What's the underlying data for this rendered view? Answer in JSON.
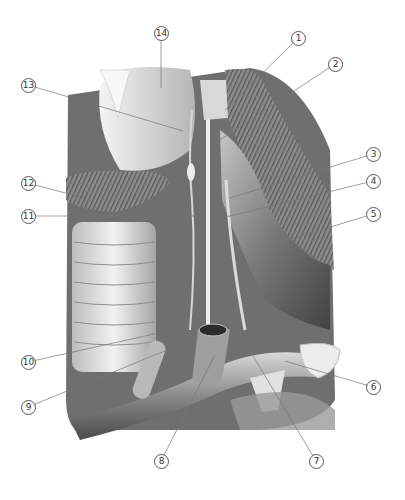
{
  "figure": {
    "type": "anatomical illustration",
    "style": "grayscale pencil rendering"
  },
  "labels": [
    {
      "n": "1",
      "glyph": "①",
      "x": 298,
      "y": 38,
      "tx": 225,
      "ty": 110
    },
    {
      "n": "2",
      "glyph": "②",
      "x": 335,
      "y": 64,
      "tx": 218,
      "ty": 141
    },
    {
      "n": "3",
      "glyph": "③",
      "x": 373,
      "y": 154,
      "tx": 230,
      "ty": 198
    },
    {
      "n": "4",
      "glyph": "④",
      "x": 373,
      "y": 181,
      "tx": 226,
      "ty": 217
    },
    {
      "n": "5",
      "glyph": "⑤",
      "x": 373,
      "y": 214,
      "tx": 262,
      "ty": 248
    },
    {
      "n": "6",
      "glyph": "⑥",
      "x": 373,
      "y": 387,
      "tx": 285,
      "ty": 361
    },
    {
      "n": "7",
      "glyph": "⑦",
      "x": 316,
      "y": 461,
      "tx": 228,
      "ty": 314
    },
    {
      "n": "8",
      "glyph": "⑧",
      "x": 161,
      "y": 461,
      "tx": 215,
      "ty": 355
    },
    {
      "n": "9",
      "glyph": "⑨",
      "x": 28,
      "y": 407,
      "tx": 172,
      "ty": 348
    },
    {
      "n": "10",
      "glyph": "⑩",
      "x": 28,
      "y": 362,
      "tx": 154,
      "ty": 334
    },
    {
      "n": "11",
      "glyph": "⑪",
      "x": 28,
      "y": 216,
      "tx": 198,
      "ty": 216
    },
    {
      "n": "12",
      "glyph": "⑫",
      "x": 28,
      "y": 183,
      "tx": 84,
      "ty": 198
    },
    {
      "n": "13",
      "glyph": "⑬",
      "x": 28,
      "y": 85,
      "tx": 183,
      "ty": 131
    },
    {
      "n": "14",
      "glyph": "⑭",
      "x": 161,
      "y": 33,
      "tx": 161,
      "ty": 88
    }
  ],
  "colors": {
    "background": "#ffffff",
    "leader_line": "#777777",
    "callout_border": "#555555",
    "tissue_light": "#e8e8e8",
    "tissue_mid": "#a9a9a9",
    "tissue_dark": "#3a3a3a"
  }
}
